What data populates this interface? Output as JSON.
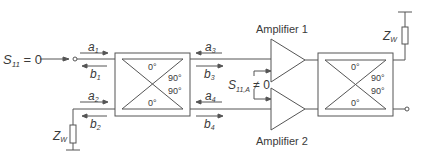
{
  "diagram": {
    "type": "balanced-amplifier",
    "input_label": {
      "symbol": "S",
      "sub": "11",
      "rest": " = 0"
    },
    "reflection_label": {
      "symbol": "S",
      "sub": "11,A",
      "rest": " ≠ 0"
    },
    "termination_label": {
      "symbol": "Z",
      "sub": "W"
    },
    "waves": [
      {
        "id": "a1",
        "symbol": "a",
        "sub": "1",
        "direction": "right"
      },
      {
        "id": "b1",
        "symbol": "b",
        "sub": "1",
        "direction": "left"
      },
      {
        "id": "a2",
        "symbol": "a",
        "sub": "2",
        "direction": "right"
      },
      {
        "id": "b2",
        "symbol": "b",
        "sub": "2",
        "direction": "left"
      },
      {
        "id": "a3",
        "symbol": "a",
        "sub": "3",
        "direction": "left"
      },
      {
        "id": "b3",
        "symbol": "b",
        "sub": "3",
        "direction": "right"
      },
      {
        "id": "a4",
        "symbol": "a",
        "sub": "4",
        "direction": "left"
      },
      {
        "id": "b4",
        "symbol": "b",
        "sub": "4",
        "direction": "right"
      }
    ],
    "hybrid_phases": {
      "top": "0°",
      "upper_right": "90°",
      "lower_right": "90°",
      "bottom": "0°"
    },
    "amplifiers": [
      {
        "label": "Amplifier 1"
      },
      {
        "label": "Amplifier 2"
      }
    ],
    "colors": {
      "line": "#555555",
      "text": "#3a3a3a"
    }
  }
}
